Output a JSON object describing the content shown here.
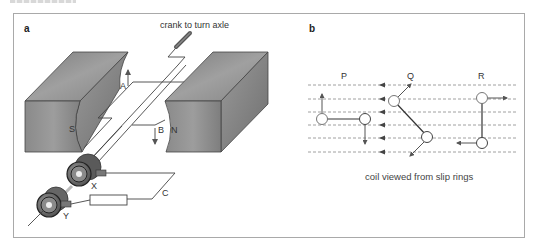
{
  "figure": {
    "panel_a": {
      "letter": "a",
      "crank_label": "crank to turn axle",
      "labels": {
        "side_A": "A",
        "side_B": "B",
        "pole_S": "S",
        "pole_N": "N",
        "slip_ring_X": "X",
        "slip_ring_Y": "Y",
        "circuit_C": "C"
      }
    },
    "panel_b": {
      "letter": "b",
      "positions": [
        "P",
        "Q",
        "R"
      ],
      "caption": "coil viewed from slip rings"
    },
    "colors": {
      "magnet": "#8c8c8c",
      "magnet_dark": "#6e6e6e",
      "magnet_light": "#a8a8a8",
      "line": "#333333",
      "field_line": "#777777",
      "frame": "#a9a9a9"
    }
  }
}
